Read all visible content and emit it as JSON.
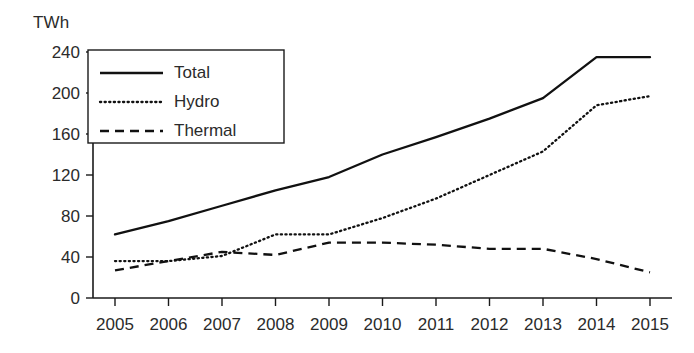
{
  "chart_data": {
    "type": "line",
    "title": "",
    "subtitle": "",
    "xlabel": "",
    "ylabel": "TWh",
    "unit_label": "TWh",
    "categories": [
      "2005",
      "2006",
      "2007",
      "2008",
      "2009",
      "2010",
      "2011",
      "2012",
      "2013",
      "2014",
      "2015"
    ],
    "x": [
      2005,
      2006,
      2007,
      2008,
      2009,
      2010,
      2011,
      2012,
      2013,
      2014,
      2015
    ],
    "series": [
      {
        "name": "Total",
        "style": "solid",
        "color": "#111111",
        "values": [
          62,
          75,
          90,
          105,
          118,
          140,
          157,
          175,
          195,
          235,
          235
        ]
      },
      {
        "name": "Hydro",
        "style": "dotted",
        "color": "#111111",
        "values": [
          36,
          36,
          41,
          62,
          62,
          78,
          97,
          120,
          143,
          188,
          197
        ]
      },
      {
        "name": "Thermal",
        "style": "dashed",
        "color": "#111111",
        "values": [
          27,
          36,
          45,
          42,
          54,
          54,
          52,
          48,
          48,
          38,
          25
        ]
      }
    ],
    "ylim": [
      0,
      240
    ],
    "yticks": [
      0,
      40,
      80,
      120,
      160,
      200,
      240
    ],
    "ytick_labels": [
      "0",
      "40",
      "80",
      "120",
      "160",
      "200",
      "240"
    ],
    "xtick_labels": [
      "2005",
      "2006",
      "2007",
      "2008",
      "2009",
      "2010",
      "2011",
      "2012",
      "2013",
      "2014",
      "2015"
    ],
    "grid": false,
    "legend_position": "upper-left",
    "legend_entries": [
      "Total",
      "Hydro",
      "Thermal"
    ]
  }
}
